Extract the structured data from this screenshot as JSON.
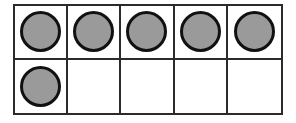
{
  "figure": {
    "name": "ten-frame",
    "rows": 2,
    "columns": 5,
    "total_cells": 10,
    "counters_shown": 6,
    "empty_cells": 4,
    "background_color": "#ffffff",
    "grid_line_color": "#2b2b2b",
    "counter_fill_color": "#9a9a9a",
    "counter_outline_color": "#111111"
  },
  "cells": [
    {
      "index": 1,
      "row": 1,
      "column": 1,
      "filled": true,
      "counter_name": "counter-1"
    },
    {
      "index": 2,
      "row": 1,
      "column": 2,
      "filled": true,
      "counter_name": "counter-2"
    },
    {
      "index": 3,
      "row": 1,
      "column": 3,
      "filled": true,
      "counter_name": "counter-3"
    },
    {
      "index": 4,
      "row": 1,
      "column": 4,
      "filled": true,
      "counter_name": "counter-4"
    },
    {
      "index": 5,
      "row": 1,
      "column": 5,
      "filled": true,
      "counter_name": "counter-5"
    },
    {
      "index": 6,
      "row": 2,
      "column": 1,
      "filled": true,
      "counter_name": "counter-6"
    },
    {
      "index": 7,
      "row": 2,
      "column": 2,
      "filled": false,
      "counter_name": null
    },
    {
      "index": 8,
      "row": 2,
      "column": 3,
      "filled": false,
      "counter_name": null
    },
    {
      "index": 9,
      "row": 2,
      "column": 4,
      "filled": false,
      "counter_name": null
    },
    {
      "index": 10,
      "row": 2,
      "column": 5,
      "filled": false,
      "counter_name": null
    }
  ]
}
